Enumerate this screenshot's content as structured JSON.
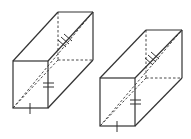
{
  "figure": {
    "stroke_color": "#333333",
    "background": "#ffffff",
    "prisms": [
      {
        "id": "left",
        "front": {
          "x1": 13,
          "y1": 61,
          "x2": 48,
          "y2": 108
        },
        "offset": {
          "dx": 45,
          "dy": -49
        }
      },
      {
        "id": "right",
        "front": {
          "x1": 100,
          "y1": 78,
          "x2": 135,
          "y2": 126
        },
        "offset": {
          "dx": 47,
          "dy": -48
        }
      }
    ],
    "marks": {
      "bottom_edge": "single tick",
      "front_right_edge": "double tick",
      "space_diagonal": "triple tick"
    }
  }
}
